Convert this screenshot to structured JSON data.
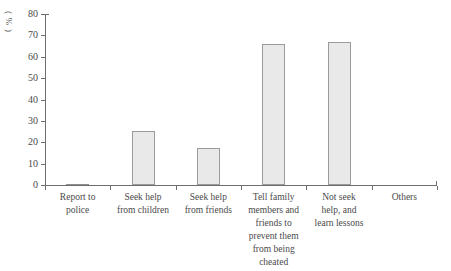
{
  "chart_data": {
    "type": "bar",
    "title": "",
    "subtitle": "",
    "xlabel": "",
    "ylabel": "(%)",
    "ylim": [
      0,
      80
    ],
    "ytick_step": 10,
    "yticks": [
      0,
      10,
      20,
      30,
      40,
      50,
      60,
      70,
      80
    ],
    "grid": false,
    "legend": "none",
    "categories": [
      "Report to police",
      "Seek help from children",
      "Seek help from friends",
      "Tell family members and friends to prevent them from being cheated",
      "Not seek help, and learn lessons",
      "Others"
    ],
    "category_label_lines": [
      [
        "Report to",
        "police"
      ],
      [
        "Seek help",
        "from children"
      ],
      [
        "Seek help",
        "from friends"
      ],
      [
        "Tell family",
        "members and",
        "friends to",
        "prevent them",
        "from being",
        "cheated"
      ],
      [
        "Not seek",
        "help, and",
        "learn lessons"
      ],
      [
        "Others"
      ]
    ],
    "values": [
      0.5,
      25.5,
      17.5,
      66,
      67,
      0
    ],
    "bar_fill_color": "#e9e9e9",
    "bar_edge_color": "#9b9b9b",
    "axis_color": "#6e6e6e",
    "text_color": "#4a4a4a",
    "background_color": "#ffffff"
  },
  "y_axis_label_chars": [
    "(",
    "%",
    ")"
  ]
}
